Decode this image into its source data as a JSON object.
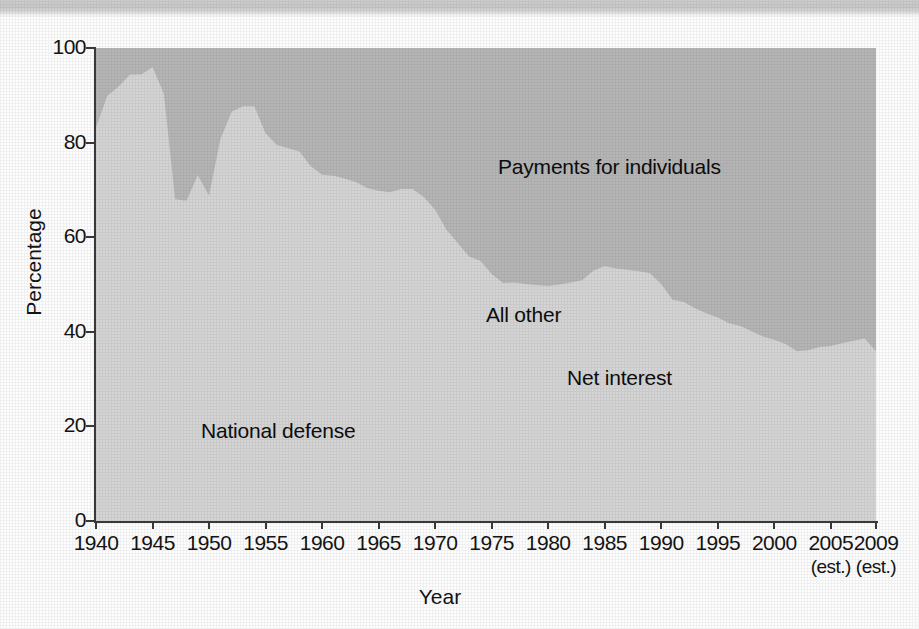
{
  "figure": {
    "ylabel": "Percentage",
    "xlabel": "Year",
    "labels": {
      "payments": "Payments for individuals",
      "all_other": "All other",
      "net_interest": "Net interest",
      "national_defense": "National defense"
    }
  },
  "colors": {
    "national_defense": "#b0b0b0",
    "net_interest": "#7e7e7e",
    "all_other": "#d5d5d5",
    "payments_for_individuals": "#b6b6b6",
    "axis": "#3a3a3a",
    "text": "#141414"
  },
  "chart_data": {
    "type": "area",
    "stacked": true,
    "title": "",
    "xlabel": "Year",
    "ylabel": "Percentage",
    "xlim": [
      1940,
      2009
    ],
    "ylim": [
      0,
      100
    ],
    "grid": false,
    "legend": "inline-annotations",
    "xticks": [
      "1940",
      "1945",
      "1950",
      "1955",
      "1960",
      "1965",
      "1970",
      "1975",
      "1980",
      "1985",
      "1990",
      "1995",
      "2000",
      "2005",
      "2009"
    ],
    "xtick_sublabels": {
      "2005": "(est.)",
      "2009": "(est.)"
    },
    "yticks": [
      0,
      20,
      40,
      60,
      80,
      100
    ],
    "x": [
      1940,
      1941,
      1942,
      1943,
      1944,
      1945,
      1946,
      1947,
      1948,
      1949,
      1950,
      1951,
      1952,
      1953,
      1954,
      1955,
      1956,
      1957,
      1958,
      1959,
      1960,
      1961,
      1962,
      1963,
      1964,
      1965,
      1966,
      1967,
      1968,
      1969,
      1970,
      1971,
      1972,
      1973,
      1974,
      1975,
      1976,
      1977,
      1978,
      1979,
      1980,
      1981,
      1982,
      1983,
      1984,
      1985,
      1986,
      1987,
      1988,
      1989,
      1990,
      1991,
      1992,
      1993,
      1994,
      1995,
      1996,
      1997,
      1998,
      1999,
      2000,
      2001,
      2002,
      2003,
      2004,
      2005,
      2006,
      2007,
      2008,
      2009
    ],
    "series": [
      {
        "name": "National defense",
        "color": "#b0b0b0",
        "values": [
          17.5,
          47.1,
          73.0,
          84.9,
          86.7,
          89.5,
          77.3,
          37.1,
          30.6,
          33.9,
          32.2,
          51.8,
          68.1,
          69.4,
          69.5,
          62.4,
          60.2,
          59.3,
          56.8,
          53.2,
          52.2,
          50.8,
          49.0,
          48.0,
          46.2,
          42.8,
          43.2,
          45.4,
          46.0,
          44.9,
          41.8,
          37.5,
          34.3,
          31.2,
          29.5,
          26.0,
          24.1,
          23.8,
          22.8,
          23.1,
          22.7,
          23.2,
          24.9,
          26.0,
          26.7,
          26.7,
          27.6,
          28.1,
          27.3,
          26.6,
          23.9,
          20.6,
          21.6,
          20.7,
          19.3,
          17.9,
          17.0,
          16.9,
          16.2,
          16.1,
          16.5,
          16.4,
          17.3,
          18.7,
          19.9,
          20.0,
          19.7,
          20.2,
          20.7,
          18.8
        ]
      },
      {
        "name": "Net interest",
        "color": "#7e7e7e",
        "values": [
          5.2,
          3.8,
          2.4,
          2.0,
          2.4,
          2.3,
          7.7,
          10.6,
          12.1,
          10.9,
          11.3,
          8.4,
          6.4,
          6.6,
          6.8,
          7.1,
          7.2,
          7.2,
          7.2,
          7.2,
          7.5,
          6.9,
          6.4,
          6.7,
          6.9,
          7.3,
          7.0,
          6.8,
          6.9,
          7.2,
          7.4,
          7.0,
          6.7,
          7.0,
          7.6,
          7.2,
          7.2,
          7.3,
          7.7,
          8.1,
          8.9,
          10.1,
          11.4,
          11.1,
          13.0,
          13.7,
          13.7,
          13.8,
          14.3,
          14.8,
          14.7,
          14.7,
          14.4,
          14.1,
          13.9,
          15.3,
          15.5,
          15.2,
          14.6,
          13.5,
          12.5,
          11.1,
          8.5,
          7.1,
          7.0,
          7.4,
          8.5,
          8.7,
          8.5,
          7.7
        ]
      },
      {
        "name": "All other",
        "color": "#d5d5d5",
        "values": [
          60.5,
          39.0,
          16.4,
          7.5,
          5.3,
          4.2,
          5.4,
          20.3,
          25.0,
          28.3,
          25.3,
          20.5,
          12.0,
          11.7,
          11.4,
          12.5,
          12.1,
          12.3,
          14.1,
          14.6,
          13.5,
          15.3,
          17.0,
          16.9,
          17.3,
          19.7,
          19.3,
          18.0,
          17.3,
          16.4,
          16.6,
          17.1,
          17.8,
          17.7,
          17.9,
          19.0,
          19.0,
          19.3,
          19.6,
          18.7,
          18.1,
          16.7,
          14.1,
          13.8,
          13.2,
          13.5,
          12.1,
          11.2,
          11.2,
          11.0,
          11.5,
          11.5,
          10.3,
          10.2,
          10.7,
          9.8,
          9.3,
          9.1,
          9.3,
          9.4,
          9.3,
          9.9,
          10.1,
          10.3,
          9.9,
          9.6,
          9.4,
          9.2,
          9.4,
          9.4
        ]
      },
      {
        "name": "Payments for individuals",
        "color": "#b6b6b6",
        "values": [
          16.8,
          10.1,
          8.2,
          5.6,
          5.6,
          4.0,
          9.6,
          32.0,
          32.3,
          26.9,
          31.2,
          19.3,
          13.5,
          12.3,
          12.3,
          18.0,
          20.5,
          21.2,
          21.9,
          25.0,
          26.8,
          27.0,
          27.6,
          28.4,
          29.6,
          30.2,
          30.5,
          29.8,
          29.8,
          31.5,
          34.2,
          38.4,
          41.2,
          44.1,
          45.0,
          47.8,
          49.7,
          49.6,
          49.9,
          50.1,
          50.3,
          50.0,
          49.6,
          49.1,
          47.1,
          46.1,
          46.6,
          46.9,
          47.2,
          47.6,
          49.9,
          53.2,
          53.7,
          55.0,
          56.1,
          57.0,
          58.2,
          58.8,
          59.9,
          61.0,
          61.7,
          62.6,
          64.1,
          63.9,
          63.2,
          63.0,
          62.4,
          61.9,
          61.4,
          64.1
        ]
      }
    ]
  }
}
